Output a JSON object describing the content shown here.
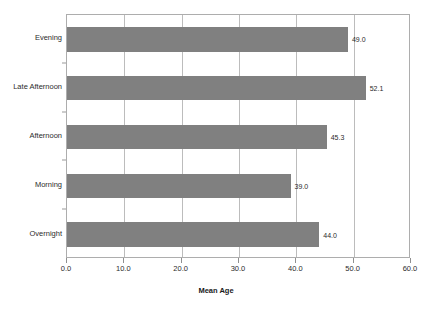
{
  "chart_data": {
    "type": "bar",
    "orientation": "horizontal",
    "title": "",
    "xlabel": "Mean Age",
    "ylabel": "",
    "categories": [
      "Evening",
      "Late Afternoon",
      "Afternoon",
      "Morning",
      "Overnight"
    ],
    "values": [
      49.0,
      52.1,
      45.3,
      39.0,
      44.0
    ],
    "data_labels": [
      "49.0",
      "52.1",
      "45.3",
      "39.0",
      "44.0"
    ],
    "xlim": [
      0.0,
      60.0
    ],
    "xticks": [
      0.0,
      10.0,
      20.0,
      30.0,
      40.0,
      50.0,
      60.0
    ],
    "xtick_labels": [
      "0.0",
      "10.0",
      "20.0",
      "30.0",
      "40.0",
      "50.0",
      "60.0"
    ],
    "grid": "vertical",
    "legend": "none",
    "bar_color": "#808080",
    "plot_border_color": "#adadad",
    "gridline_color": "#bcbcbc",
    "background_color": "#ffffff"
  }
}
